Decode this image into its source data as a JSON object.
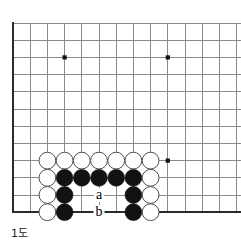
{
  "figure": {
    "kind": "go-board-diagram",
    "caption": "1도",
    "width": 241,
    "height": 246
  },
  "board": {
    "origin_x": 13,
    "origin_y": 23,
    "spacing": 17.2,
    "cols": 14,
    "rows": 12,
    "stone_radius": 8.4,
    "line_color": "#8a8a8a",
    "edge_color": "#2b2b2b",
    "black_color": "#121212",
    "white_fill": "#ffffff",
    "white_stroke": "#4d4d4d",
    "edges": {
      "left": true,
      "top": false,
      "right": false,
      "bottom": true
    },
    "star_points": [
      {
        "col": 3,
        "row": 2
      },
      {
        "col": 9,
        "row": 2
      },
      {
        "col": 9,
        "row": 8
      }
    ],
    "stones": [
      {
        "col": 2,
        "row": 8,
        "color": "white"
      },
      {
        "col": 3,
        "row": 8,
        "color": "white"
      },
      {
        "col": 4,
        "row": 8,
        "color": "white"
      },
      {
        "col": 5,
        "row": 8,
        "color": "white"
      },
      {
        "col": 6,
        "row": 8,
        "color": "white"
      },
      {
        "col": 7,
        "row": 8,
        "color": "white"
      },
      {
        "col": 8,
        "row": 8,
        "color": "white"
      },
      {
        "col": 2,
        "row": 9,
        "color": "white"
      },
      {
        "col": 3,
        "row": 9,
        "color": "black"
      },
      {
        "col": 4,
        "row": 9,
        "color": "black"
      },
      {
        "col": 5,
        "row": 9,
        "color": "black"
      },
      {
        "col": 6,
        "row": 9,
        "color": "black"
      },
      {
        "col": 7,
        "row": 9,
        "color": "black"
      },
      {
        "col": 8,
        "row": 9,
        "color": "white"
      },
      {
        "col": 2,
        "row": 10,
        "color": "white"
      },
      {
        "col": 3,
        "row": 10,
        "color": "black"
      },
      {
        "col": 7,
        "row": 10,
        "color": "black"
      },
      {
        "col": 8,
        "row": 10,
        "color": "white"
      },
      {
        "col": 2,
        "row": 11,
        "color": "white"
      },
      {
        "col": 3,
        "row": 11,
        "color": "black"
      },
      {
        "col": 7,
        "row": 11,
        "color": "black"
      },
      {
        "col": 8,
        "row": 11,
        "color": "white"
      }
    ],
    "labels": [
      {
        "text": "a",
        "col": 5,
        "row": 10
      },
      {
        "text": "b",
        "col": 5,
        "row": 11
      }
    ]
  }
}
